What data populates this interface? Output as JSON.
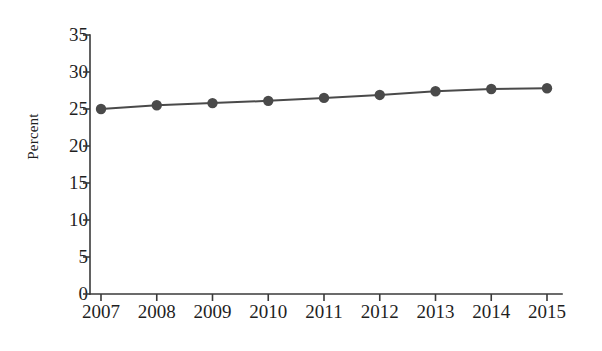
{
  "chart_data": {
    "type": "line",
    "title": "",
    "subtitle": "",
    "xlabel": "",
    "ylabel": "Percent",
    "categories": [
      "2007",
      "2008",
      "2009",
      "2010",
      "2011",
      "2012",
      "2013",
      "2014",
      "2015"
    ],
    "x": [
      2007,
      2008,
      2009,
      2010,
      2011,
      2012,
      2013,
      2014,
      2015
    ],
    "values": [
      25.0,
      25.5,
      25.8,
      26.1,
      26.5,
      26.9,
      27.4,
      27.7,
      27.8
    ],
    "series": [
      {
        "name": "Percent",
        "values": [
          25.0,
          25.5,
          25.8,
          26.1,
          26.5,
          26.9,
          27.4,
          27.7,
          27.8
        ],
        "color": "#4a4a4a",
        "marker": "circle",
        "line_width": 2
      }
    ],
    "ylim": [
      0,
      35
    ],
    "yticks": [
      0,
      5,
      10,
      15,
      20,
      25,
      30,
      35
    ],
    "ytick_labels": [
      "0",
      "5",
      "10",
      "15",
      "20",
      "25",
      "30",
      "35"
    ],
    "xtick_labels": [
      "2007",
      "2008",
      "2009",
      "2010",
      "2011",
      "2012",
      "2013",
      "2014",
      "2015"
    ],
    "grid": false,
    "legend": false,
    "legend_position": "none",
    "annotations": [],
    "axis_color": "#3a3a3a",
    "background_color": "#ffffff",
    "tick_direction": "out",
    "spines": [
      "left",
      "bottom"
    ]
  }
}
